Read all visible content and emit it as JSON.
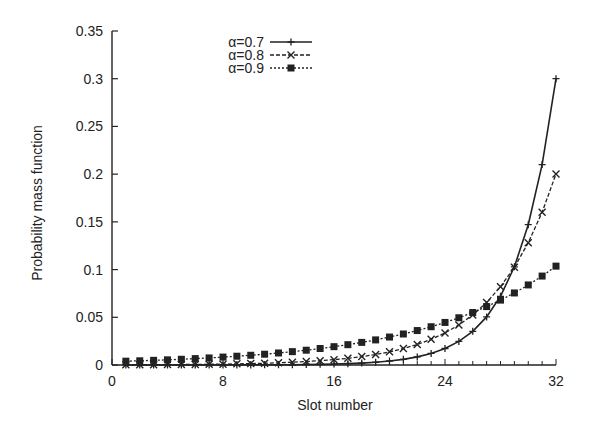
{
  "chart_data": {
    "type": "line",
    "title": "",
    "xlabel": "Slot number",
    "ylabel": "Probability mass function",
    "xlim": [
      0,
      32
    ],
    "ylim": [
      0,
      0.35
    ],
    "xticks": [
      0,
      8,
      16,
      24,
      32
    ],
    "xtick_labels": [
      "0",
      "8",
      "16",
      "24",
      "32"
    ],
    "yticks": [
      0,
      0.05,
      0.1,
      0.15,
      0.2,
      0.25,
      0.3,
      0.35
    ],
    "ytick_labels": [
      "0",
      "0.05",
      "0.1",
      "0.15",
      "0.2",
      "0.25",
      "0.3",
      "0.35"
    ],
    "grid": false,
    "legend_position": "upper-center",
    "x": [
      1,
      2,
      3,
      4,
      5,
      6,
      7,
      8,
      9,
      10,
      11,
      12,
      13,
      14,
      15,
      16,
      17,
      18,
      19,
      20,
      21,
      22,
      23,
      24,
      25,
      26,
      27,
      28,
      29,
      30,
      31,
      32
    ],
    "series": [
      {
        "name": "α=0.7",
        "line_style": "solid",
        "marker": "plus",
        "values": [
          0,
          0,
          0,
          0,
          0,
          0,
          0,
          0,
          0.0001,
          0.0001,
          0.0002,
          0.0002,
          0.0003,
          0.0005,
          0.0007,
          0.001,
          0.0014,
          0.002,
          0.0029,
          0.0042,
          0.0059,
          0.0085,
          0.0121,
          0.0173,
          0.0247,
          0.0353,
          0.0504,
          0.072,
          0.1029,
          0.147,
          0.21,
          0.3
        ]
      },
      {
        "name": "α=0.8",
        "line_style": "dashed",
        "marker": "cross",
        "values": [
          0.0002,
          0.0002,
          0.0003,
          0.0004,
          0.0005,
          0.0006,
          0.0008,
          0.0009,
          0.0012,
          0.0015,
          0.0018,
          0.0023,
          0.0029,
          0.0036,
          0.0045,
          0.0056,
          0.007,
          0.0088,
          0.011,
          0.0138,
          0.0172,
          0.0215,
          0.0269,
          0.0336,
          0.042,
          0.0525,
          0.0656,
          0.082,
          0.1025,
          0.1281,
          0.1601,
          0.2002
        ]
      },
      {
        "name": "α=0.9",
        "line_style": "dotted",
        "marker": "filled-square",
        "values": [
          0.004,
          0.0044,
          0.0049,
          0.0054,
          0.006,
          0.0067,
          0.0074,
          0.0083,
          0.0092,
          0.0102,
          0.0113,
          0.0126,
          0.014,
          0.0155,
          0.0173,
          0.0192,
          0.0213,
          0.0237,
          0.0263,
          0.0293,
          0.0325,
          0.0361,
          0.0401,
          0.0446,
          0.0495,
          0.055,
          0.0612,
          0.068,
          0.0755,
          0.0839,
          0.0932,
          0.1036
        ]
      }
    ]
  },
  "legend": {
    "items": [
      "α=0.7",
      "α=0.8",
      "α=0.9"
    ]
  },
  "axes": {
    "xlabel": "Slot number",
    "ylabel": "Probability mass function"
  }
}
